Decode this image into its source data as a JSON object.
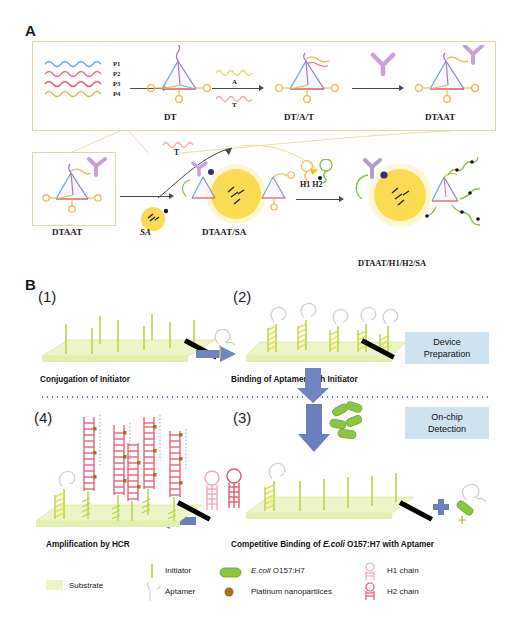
{
  "figure": {
    "panels": [
      {
        "letter": "A"
      },
      {
        "letter": "B"
      }
    ]
  },
  "panelA": {
    "strand_labels": [
      "P1",
      "P2",
      "P3",
      "P4"
    ],
    "strand_colors": [
      "#6fa8dc",
      "#e0709c",
      "#e05a58",
      "#e7b94e"
    ],
    "products": [
      {
        "name": "DT"
      },
      {
        "name": "DT/A/T"
      },
      {
        "name": "DTAAT"
      }
    ],
    "arrow2_top_label": "A",
    "arrow2_bottom_label": "T",
    "row2": {
      "start_label": "DTAAT",
      "sa_label": "SA",
      "released_label": "T",
      "mid_label": "DTAAT/SA",
      "hcr_arrow_label": "H1 H2",
      "final_label": "DTAAT/H1/H2/SA"
    }
  },
  "panelB": {
    "steps": [
      {
        "number": "(1)",
        "caption": "Conjugation of Initiator"
      },
      {
        "number": "(2)",
        "caption": "Binding of Aptamer with Initiator"
      },
      {
        "number": "(3)",
        "caption_prefix": "Competitive Binding of ",
        "caption_italic": "E.coli",
        "caption_suffix": " O157:H7 with Aptamer"
      },
      {
        "number": "(4)",
        "caption": "Amplification by HCR"
      }
    ],
    "badges": [
      {
        "line1": "Device",
        "line2": "Preparation"
      },
      {
        "line1": "On-chip",
        "line2": "Detection"
      }
    ]
  },
  "legend": {
    "items": [
      {
        "key": "substrate",
        "label": "Substrate",
        "color": "#edf5c8"
      },
      {
        "key": "initiator",
        "label": "Initiator",
        "color": "#b7d64a"
      },
      {
        "key": "aptamer",
        "label": "Aptamer",
        "color": "#cfcfcf"
      },
      {
        "key": "ecoli",
        "label_italic": "E.coli",
        "label": " O157:H7",
        "color": "#8cc63f"
      },
      {
        "key": "platinum",
        "label": "Platinum nanopartilces",
        "color": "#a8701f"
      },
      {
        "key": "h1",
        "label": "H1 chain",
        "color": "#f0a8bc"
      },
      {
        "key": "h2",
        "label": "H2 chain",
        "color": "#e8556f"
      }
    ]
  },
  "colors": {
    "frame": "#e3d9a8",
    "badge_bg": "#cfe2f0",
    "arrow_blue": "#6b7fc0",
    "sa_yellow": "#fcd535",
    "antibody_purple": "#c9a0d8",
    "green_chain": "#7dc242",
    "substrate": "#edf5c8",
    "initiator": "#b7d64a",
    "hcr_red": "#e8556f",
    "dark_arrow": "#4a4a4a"
  }
}
